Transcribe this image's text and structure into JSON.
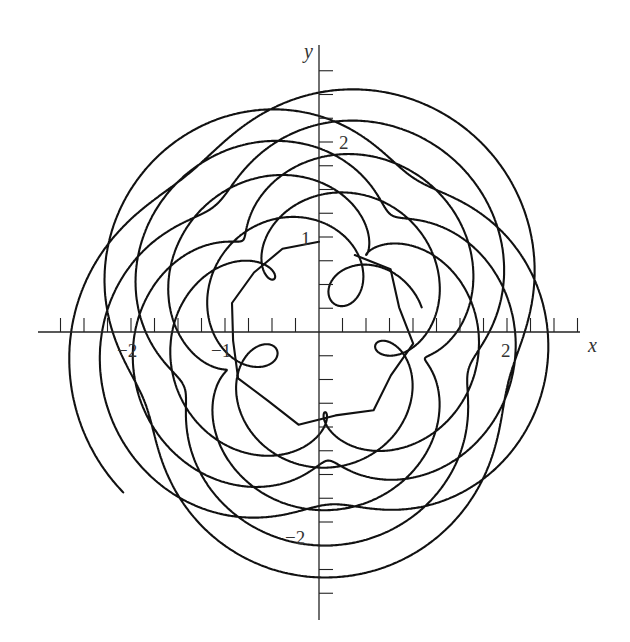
{
  "chart_data": {
    "type": "line",
    "subtype": "parametric-trajectory",
    "title": "",
    "xlabel": "x",
    "ylabel": "y",
    "xlim": [
      -2.95,
      2.8
    ],
    "ylim": [
      -3.05,
      3.0
    ],
    "x_tick_step": 0.25,
    "y_tick_step": 0.25,
    "x_tick_labels": [
      {
        "value": -2,
        "label": "−2"
      },
      {
        "value": -1,
        "label": "−1"
      },
      {
        "value": 2,
        "label": "2"
      }
    ],
    "y_tick_labels": [
      {
        "value": 2,
        "label": "2"
      },
      {
        "value": 1,
        "label": "1"
      },
      {
        "value": -2,
        "label": "−2"
      }
    ],
    "grid": false,
    "legend": null,
    "series": [
      {
        "name": "trajectory",
        "color": "#111111",
        "description": "Looping orbit starting near r≈1 (inner ring with ~7 small loops) and spiraling outward to r≈2.7",
        "r_inner": 0.95,
        "r_outer": 2.72,
        "loop_count_inner": 7
      }
    ]
  },
  "axes": {
    "x_label": "x",
    "y_label": "y"
  }
}
